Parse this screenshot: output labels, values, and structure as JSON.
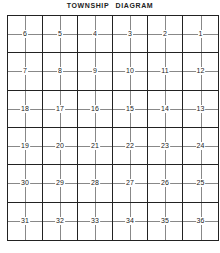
{
  "title": "TOWNSHIP   DIAGRAM",
  "sections": [
    [
      "6",
      "5",
      "4",
      "3",
      "2",
      "1"
    ],
    [
      "7",
      "8",
      "9",
      "10",
      "11",
      "12"
    ],
    [
      "18",
      "17",
      "16",
      "15",
      "14",
      "13"
    ],
    [
      "19",
      "20",
      "21",
      "22",
      "23",
      "24"
    ],
    [
      "30",
      "29",
      "28",
      "27",
      "26",
      "25"
    ],
    [
      "31",
      "32",
      "33",
      "34",
      "35",
      "36"
    ]
  ],
  "colors": {
    "line": "#222222",
    "subline": "#888888",
    "background": "#ffffff"
  }
}
